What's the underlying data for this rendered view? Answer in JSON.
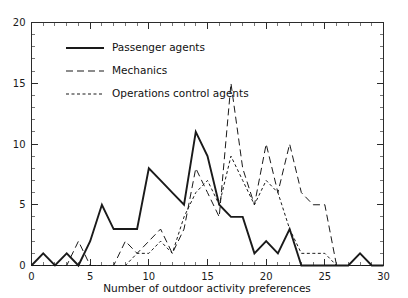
{
  "chart_data": {
    "type": "line",
    "title": "",
    "xlabel": "Number of outdoor activity preferences",
    "ylabel": "",
    "xlim": [
      0,
      30
    ],
    "ylim": [
      0,
      20
    ],
    "x_major_ticks": [
      0,
      5,
      10,
      15,
      20,
      25,
      30
    ],
    "x_major_tick_labels": [
      "0",
      "5",
      "10",
      "15",
      "20",
      "25",
      "30"
    ],
    "x_minor_tick_step": 1,
    "y_major_ticks": [
      0,
      5,
      10,
      15,
      20
    ],
    "y_major_tick_labels": [
      "0",
      "5",
      "10",
      "15",
      "20"
    ],
    "y_minor_tick_step": 1,
    "grid": false,
    "legend_position": "upper-left-inside",
    "x": [
      0,
      1,
      2,
      3,
      4,
      5,
      6,
      7,
      8,
      9,
      10,
      11,
      12,
      13,
      14,
      15,
      16,
      17,
      18,
      19,
      20,
      21,
      22,
      23,
      24,
      25,
      26,
      27,
      28,
      29,
      30
    ],
    "series": [
      {
        "name": "Passenger agents",
        "style": "solid",
        "values": [
          0,
          1,
          0,
          1,
          0,
          2,
          5,
          3,
          3,
          3,
          8,
          7,
          6,
          5,
          11,
          9,
          5,
          4,
          4,
          1,
          2,
          1,
          3,
          0,
          0,
          0,
          0,
          0,
          1,
          0,
          0
        ]
      },
      {
        "name": "Mechanics",
        "style": "dashed",
        "values": [
          0,
          0,
          0,
          0,
          2,
          0,
          0,
          0,
          2,
          1,
          2,
          3,
          1,
          3,
          8,
          6,
          4,
          15,
          8,
          5,
          10,
          6,
          10,
          6,
          5,
          5,
          0,
          0,
          0,
          0,
          0
        ]
      },
      {
        "name": "Operations control agents",
        "style": "dotted",
        "values": [
          0,
          0,
          0,
          0,
          0,
          0,
          0,
          0,
          0,
          1,
          1,
          2,
          1,
          4,
          6,
          7,
          5,
          9,
          7,
          5,
          7,
          6,
          3,
          1,
          1,
          1,
          0,
          0,
          0,
          0,
          0
        ]
      }
    ]
  },
  "legend": {
    "entries": [
      {
        "label": "Passenger agents"
      },
      {
        "label": "Mechanics"
      },
      {
        "label": "Operations control agents"
      }
    ]
  },
  "colors": {
    "ink": "#1a1a1a",
    "background": "#ffffff"
  }
}
